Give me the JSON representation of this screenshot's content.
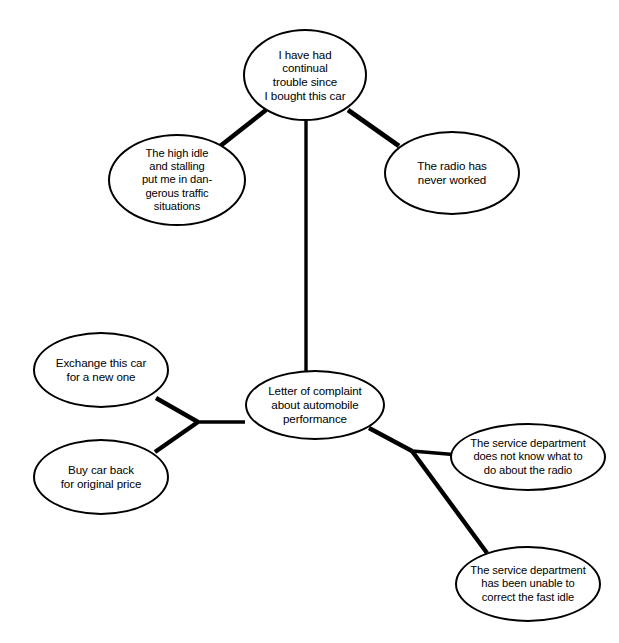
{
  "diagram": {
    "type": "cluster-diagram",
    "stroke_color": "#000000",
    "fill_color": "#ffffff",
    "background": "#ffffff",
    "nodes": [
      {
        "id": "center",
        "role": "central-topic",
        "label": "Letter of complaint\nabout automobile\nperformance",
        "cx": 315,
        "cy": 405,
        "rx": 70,
        "ry": 35
      },
      {
        "id": "trouble",
        "role": "branch",
        "label": "I have had\ncontinual\ntrouble since\nI bought this car",
        "cx": 305,
        "cy": 75,
        "rx": 62,
        "ry": 46
      },
      {
        "id": "idle-stalling",
        "role": "sub-branch",
        "label": "The high idle\nand stalling\nput me in dan-\ngerous traffic\nsituations",
        "cx": 177,
        "cy": 180,
        "rx": 69,
        "ry": 46
      },
      {
        "id": "radio-never-worked",
        "role": "sub-branch",
        "label": "The radio has\nnever worked",
        "cx": 452,
        "cy": 173,
        "rx": 68,
        "ry": 42
      },
      {
        "id": "exchange-car",
        "role": "branch",
        "label": "Exchange this car\nfor a new one",
        "cx": 101,
        "cy": 370,
        "rx": 68,
        "ry": 38
      },
      {
        "id": "buy-car-back",
        "role": "branch",
        "label": "Buy car back\nfor original price",
        "cx": 101,
        "cy": 477,
        "rx": 68,
        "ry": 38
      },
      {
        "id": "service-radio",
        "role": "branch",
        "label": "The service department\ndoes not know what to\ndo about the radio",
        "cx": 528,
        "cy": 457,
        "rx": 78,
        "ry": 34
      },
      {
        "id": "service-fast-idle",
        "role": "branch",
        "label": "The service department\nhas been unable to\ncorrect the fast idle",
        "cx": 528,
        "cy": 584,
        "rx": 73,
        "ry": 38
      }
    ],
    "edges": [
      {
        "id": "edge-center-trouble",
        "from": "center",
        "to": "trouble",
        "style": "vertical-line"
      },
      {
        "id": "edge-trouble-idle",
        "from": "trouble",
        "to": "idle-stalling",
        "style": "diagonal"
      },
      {
        "id": "edge-trouble-radio",
        "from": "trouble",
        "to": "radio-never-worked",
        "style": "diagonal"
      },
      {
        "id": "edge-center-left-junction",
        "from": "center",
        "to": "left-junction",
        "style": "horizontal"
      },
      {
        "id": "edge-left-junction-exchange",
        "from": "left-junction",
        "to": "exchange-car",
        "style": "diagonal"
      },
      {
        "id": "edge-left-junction-buyback",
        "from": "left-junction",
        "to": "buy-car-back",
        "style": "diagonal"
      },
      {
        "id": "edge-center-right-junction",
        "from": "center",
        "to": "right-junction",
        "style": "diagonal"
      },
      {
        "id": "edge-right-junction-service-radio",
        "from": "right-junction",
        "to": "service-radio",
        "style": "horizontal"
      },
      {
        "id": "edge-right-junction-service-idle",
        "from": "right-junction",
        "to": "service-fast-idle",
        "style": "diagonal"
      }
    ],
    "junctions": [
      {
        "id": "left-junction",
        "x": 198,
        "y": 422
      },
      {
        "id": "right-junction",
        "x": 412,
        "y": 451
      }
    ]
  }
}
